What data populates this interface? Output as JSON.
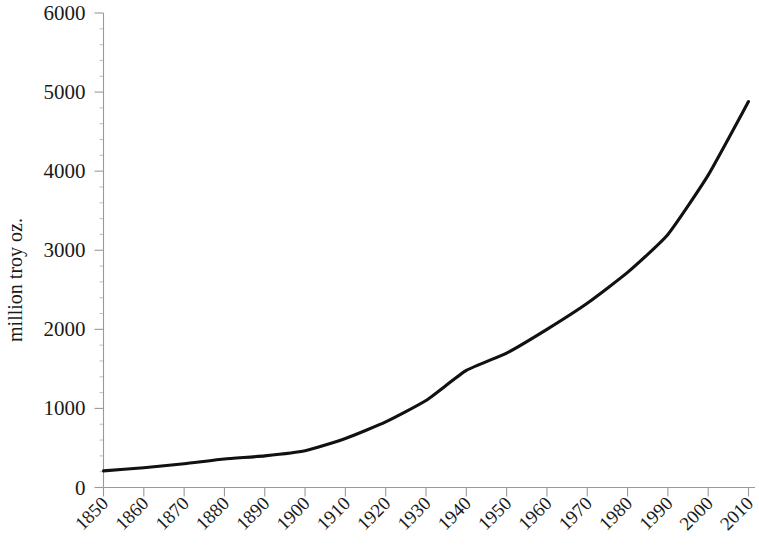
{
  "chart_data": {
    "type": "line",
    "title": "",
    "subtitle": "",
    "xlabel": "",
    "ylabel": "million troy oz.",
    "xlim": [
      1850,
      2010
    ],
    "ylim": [
      0,
      6000
    ],
    "grid": false,
    "legend": null,
    "x_tick_labels": [
      "1850",
      "1860",
      "1870",
      "1880",
      "1890",
      "1900",
      "1910",
      "1920",
      "1930",
      "1940",
      "1950",
      "1960",
      "1970",
      "1980",
      "1990",
      "2000",
      "2010"
    ],
    "y_tick_labels": [
      "0",
      "1000",
      "2000",
      "3000",
      "4000",
      "5000",
      "6000"
    ],
    "y_tick_values": [
      0,
      1000,
      2000,
      3000,
      4000,
      5000,
      6000
    ],
    "x": [
      1850,
      1860,
      1870,
      1880,
      1890,
      1900,
      1910,
      1920,
      1930,
      1940,
      1950,
      1960,
      1970,
      1980,
      1990,
      2000,
      2010
    ],
    "values": [
      210,
      250,
      300,
      360,
      400,
      465,
      620,
      830,
      1100,
      1480,
      1700,
      2000,
      2330,
      2720,
      3200,
      3950,
      4880
    ],
    "series": [
      {
        "name": "million troy oz.",
        "color": "#111111",
        "values": [
          210,
          250,
          300,
          360,
          400,
          465,
          620,
          830,
          1100,
          1480,
          1700,
          2000,
          2330,
          2720,
          3200,
          3950,
          4880
        ]
      }
    ],
    "annotations": []
  },
  "axes": {
    "y_axis_title": "million troy oz.",
    "minor_ticks_per_major_y": 5,
    "axis_color": "#9a9a9a"
  }
}
